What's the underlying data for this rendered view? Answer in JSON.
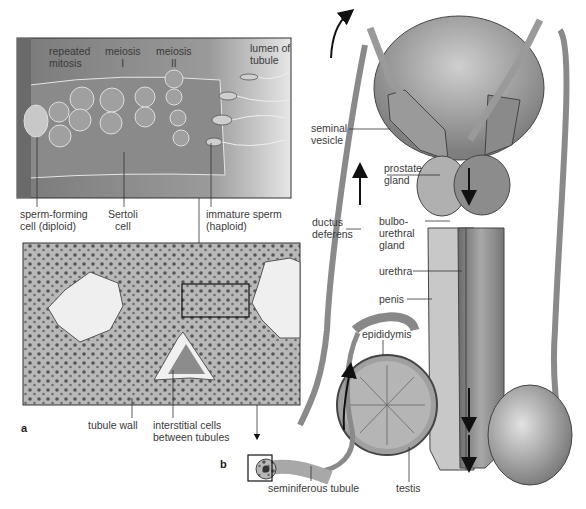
{
  "figure": {
    "panel_a": {
      "letter": "a",
      "drawing_labels": {
        "repeated_mitosis": [
          "repeated",
          "mitosis"
        ],
        "meiosis_1": [
          "meiosis",
          "I"
        ],
        "meiosis_2": [
          "meiosis",
          "II"
        ],
        "lumen": [
          "lumen of",
          "tubule"
        ],
        "sperm_forming_cell": [
          "sperm-forming",
          "cell (diploid)"
        ],
        "sertoli_cell": [
          "Sertoli",
          "cell"
        ],
        "immature_sperm": [
          "immature sperm",
          "(haploid)"
        ]
      },
      "micrograph_labels": {
        "tubule_wall": "tubule wall",
        "interstitial_cells": [
          "interstitial cells",
          "between tubules"
        ]
      }
    },
    "panel_b": {
      "letter": "b",
      "labels": {
        "seminal_vesicle": [
          "seminal",
          "vesicle"
        ],
        "prostate_gland": [
          "prostate",
          "gland"
        ],
        "ductus_deferens": [
          "ductus",
          "deferens"
        ],
        "bulbourethral_gland": [
          "bulbo-",
          "urethral",
          "gland"
        ],
        "urethra": "urethra",
        "penis": "penis",
        "epididymis": "epididymis",
        "seminiferous_tubule": "seminiferous tubule",
        "testis": "testis"
      }
    },
    "colors": {
      "drawing_bg": "#8c8c8c",
      "tissue_dark": "#6e6e6e",
      "tissue_mid": "#a6a6a6",
      "tissue_light": "#d8d8d8",
      "lumen": "#f2f2f2",
      "outline": "#333333",
      "arrow": "#111111"
    }
  }
}
